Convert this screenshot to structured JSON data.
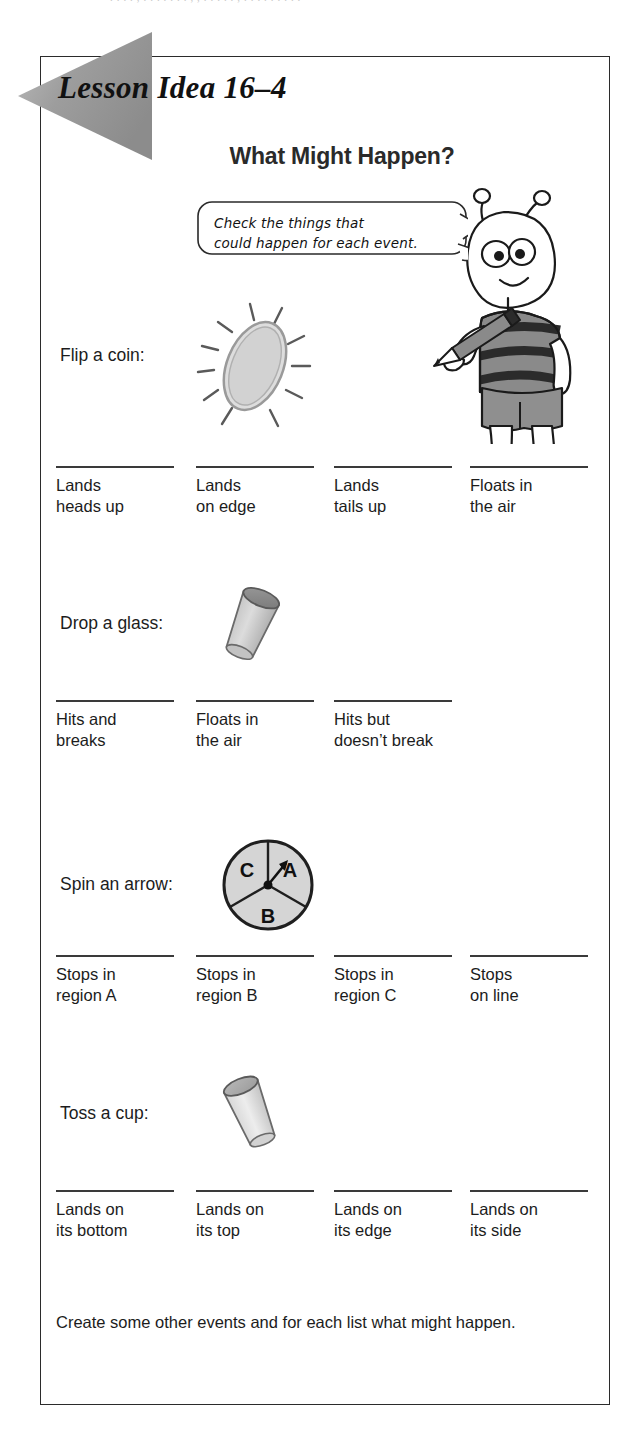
{
  "scan": {
    "top_cut_text": ". . . .    , . . . . . .  . , , .  . . . .  , . . . . . . . . ."
  },
  "header": {
    "lesson_title": "Lesson Idea 16–4",
    "worksheet_title": "What Might Happen?"
  },
  "instruction_bubble": {
    "line1": "Check the things that",
    "line2": "could happen for each event."
  },
  "character": {
    "name": "alien-with-pencil",
    "shirt_stripe_color": "#8a8a8a",
    "shirt_dark_color": "#2b2b2b",
    "shorts_color": "#8f8f8f",
    "skin_color": "#ffffff"
  },
  "colors": {
    "ink": "#1c1c1c",
    "rule": "#3a3a3a",
    "border": "#2b2b2b",
    "banner_gray": "#9a9a9a",
    "art_fill": "#d8d8d8",
    "art_fill_light": "#e6e6e6",
    "art_stroke": "#4a4a4a"
  },
  "events": [
    {
      "id": "flip-a-coin",
      "label": "Flip a coin:",
      "art": "coin-with-motion-lines",
      "options": [
        {
          "line1": "Lands",
          "line2": "heads up"
        },
        {
          "line1": "Lands",
          "line2": "on edge"
        },
        {
          "line1": "Lands",
          "line2": "tails up"
        },
        {
          "line1": "Floats in",
          "line2": "the air"
        }
      ]
    },
    {
      "id": "drop-a-glass",
      "label": "Drop a glass:",
      "art": "tilted-glass",
      "options": [
        {
          "line1": "Hits and",
          "line2": "breaks"
        },
        {
          "line1": "Floats in",
          "line2": "the air"
        },
        {
          "line1": "Hits but",
          "line2": "doesn’t break"
        }
      ]
    },
    {
      "id": "spin-an-arrow",
      "label": "Spin an arrow:",
      "art": "spinner-three-regions",
      "spinner": {
        "regions": [
          "A",
          "B",
          "C"
        ],
        "arrow_points_to": "A"
      },
      "options": [
        {
          "line1": "Stops in",
          "line2": "region A"
        },
        {
          "line1": "Stops in",
          "line2": "region B"
        },
        {
          "line1": "Stops in",
          "line2": "region C"
        },
        {
          "line1": "Stops",
          "line2": "on line"
        }
      ]
    },
    {
      "id": "toss-a-cup",
      "label": "Toss a cup:",
      "art": "tilted-cup",
      "options": [
        {
          "line1": "Lands on",
          "line2": "its bottom"
        },
        {
          "line1": "Lands on",
          "line2": "its top"
        },
        {
          "line1": "Lands on",
          "line2": "its edge"
        },
        {
          "line1": "Lands on",
          "line2": "its side"
        }
      ]
    }
  ],
  "footer": {
    "text": "Create some other events and for each list what might happen."
  }
}
